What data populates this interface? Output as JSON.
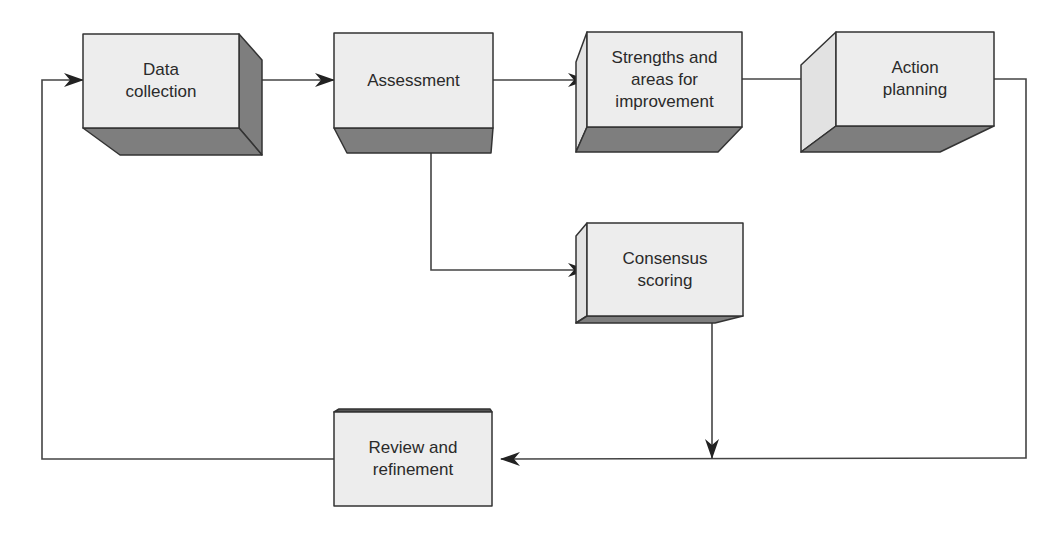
{
  "diagram": {
    "type": "flowchart",
    "colors": {
      "front_face": "#ededed",
      "side_face_light": "#e2e2e2",
      "shade_face": "#7e7e7e",
      "stroke": "#333333",
      "connector": "#444444"
    },
    "nodes": [
      {
        "id": "data-collection",
        "label": "Data\ncollection"
      },
      {
        "id": "assessment",
        "label": "Assessment"
      },
      {
        "id": "strengths",
        "label": "Strengths and\nareas for\nimprovement"
      },
      {
        "id": "action-planning",
        "label": "Action\nplanning"
      },
      {
        "id": "consensus-scoring",
        "label": "Consensus\nscoring"
      },
      {
        "id": "review-refinement",
        "label": "Review and\nrefinement"
      }
    ],
    "edges": [
      {
        "from": "data-collection",
        "to": "assessment"
      },
      {
        "from": "assessment",
        "to": "strengths"
      },
      {
        "from": "strengths",
        "to": "action-planning"
      },
      {
        "from": "assessment",
        "to": "consensus-scoring"
      },
      {
        "from": "consensus-scoring",
        "to": "review-refinement"
      },
      {
        "from": "action-planning",
        "to": "review-refinement"
      },
      {
        "from": "review-refinement",
        "to": "data-collection"
      }
    ]
  }
}
